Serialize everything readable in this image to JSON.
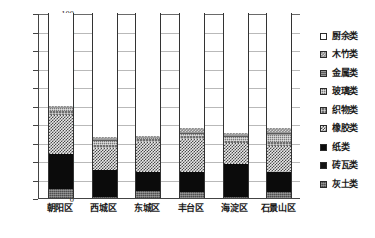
{
  "chart_data": {
    "type": "bar",
    "stacked": true,
    "title": "",
    "xlabel": "",
    "ylabel": "",
    "ylim": [
      0,
      100
    ],
    "yticks": [
      0,
      10,
      20,
      30,
      40,
      50,
      60,
      70,
      80,
      90,
      100
    ],
    "grid": true,
    "legend_position": "right",
    "categories": [
      "朝阳区",
      "西城区",
      "东城区",
      "丰台区",
      "海淀区",
      "石景山区"
    ],
    "series": [
      {
        "name": "灰土类",
        "fill": "ash",
        "values": [
          5.0,
          0.5,
          4.0,
          3.5,
          0.5,
          3.5
        ]
      },
      {
        "name": "砖瓦类",
        "fill": "brick",
        "values": [
          0.0,
          0.0,
          0.0,
          0.0,
          0.0,
          0.0
        ]
      },
      {
        "name": "纸类",
        "fill": "paper",
        "values": [
          19.0,
          14.5,
          10.0,
          10.5,
          18.0,
          10.5
        ]
      },
      {
        "name": "橡胶类",
        "fill": "rubber",
        "values": [
          21.0,
          12.0,
          16.5,
          18.0,
          11.5,
          14.0
        ]
      },
      {
        "name": "织物类",
        "fill": "fabric",
        "values": [
          2.0,
          1.5,
          1.5,
          1.5,
          1.0,
          2.5
        ]
      },
      {
        "name": "玻璃类",
        "fill": "glass",
        "values": [
          1.5,
          2.5,
          0.5,
          1.0,
          2.0,
          3.5
        ]
      },
      {
        "name": "金属类",
        "fill": "metal",
        "values": [
          0.8,
          1.0,
          0.5,
          1.0,
          1.0,
          1.5
        ]
      },
      {
        "name": "木竹类",
        "fill": "wood",
        "values": [
          0.7,
          1.0,
          0.5,
          2.5,
          1.0,
          2.5
        ]
      },
      {
        "name": "厨余类",
        "fill": "kitchen",
        "values": [
          50.0,
          67.0,
          66.5,
          62.0,
          65.0,
          62.0
        ]
      }
    ],
    "legend_order": [
      "厨余类",
      "木竹类",
      "金属类",
      "玻璃类",
      "织物类",
      "橡胶类",
      "纸类",
      "砖瓦类",
      "灰土类"
    ],
    "legend_fills": [
      "kitchen",
      "wood",
      "metal",
      "glass",
      "fabric",
      "rubber",
      "paper",
      "brick",
      "ash"
    ]
  }
}
